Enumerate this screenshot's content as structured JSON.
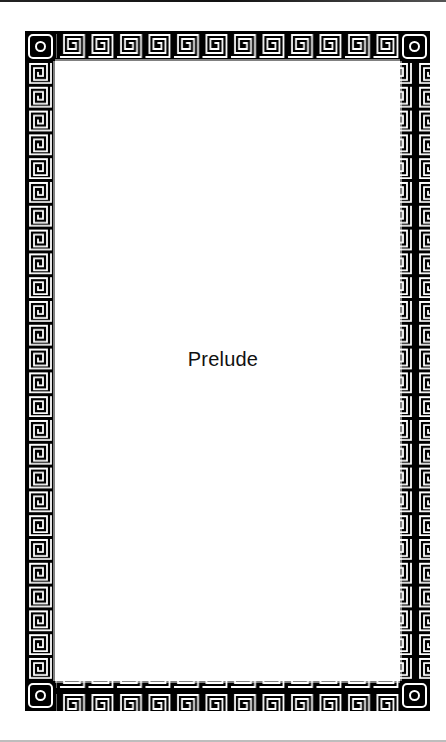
{
  "page": {
    "title": "Prelude"
  },
  "border": {
    "style": "greek-key-meander",
    "frame_color": "#000000",
    "line_color": "#ffffff",
    "top_units": 12,
    "side_units": 26,
    "corner_ornament": "ring-in-rounded-square"
  },
  "colors": {
    "background": "#ffffff",
    "text": "#111111"
  }
}
